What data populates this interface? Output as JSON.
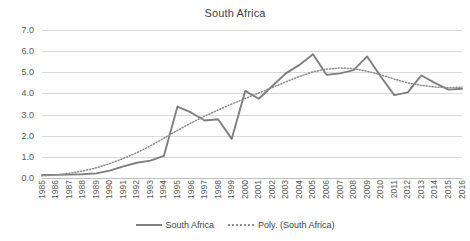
{
  "chart_data": {
    "type": "line",
    "title": "South Africa",
    "xlabel": "",
    "ylabel": "",
    "ylim": [
      0.0,
      7.0
    ],
    "y_ticks": [
      "0.0",
      "1.0",
      "2.0",
      "3.0",
      "4.0",
      "5.0",
      "6.0",
      "7.0"
    ],
    "y_tick_values": [
      0.0,
      1.0,
      2.0,
      3.0,
      4.0,
      5.0,
      6.0,
      7.0
    ],
    "grid": true,
    "legend_position": "bottom",
    "categories": [
      "1985",
      "1986",
      "1987",
      "1988",
      "1989",
      "1990",
      "1991",
      "1992",
      "1993",
      "1994",
      "1995",
      "1996",
      "1997",
      "1998",
      "1999",
      "2000",
      "2001",
      "2002",
      "2003",
      "2004",
      "2005",
      "2006",
      "2007",
      "2008",
      "2009",
      "2010",
      "2011",
      "2012",
      "2013",
      "2014",
      "2015",
      "2016"
    ],
    "series": [
      {
        "name": "South Africa",
        "style": "solid",
        "color": "#7f7f7f",
        "values": [
          0.15,
          0.15,
          0.16,
          0.18,
          0.22,
          0.35,
          0.55,
          0.72,
          0.82,
          1.05,
          3.38,
          3.1,
          2.72,
          2.78,
          1.85,
          4.12,
          3.75,
          4.35,
          4.95,
          5.35,
          5.85,
          4.88,
          4.95,
          5.1,
          5.75,
          4.8,
          3.92,
          4.05,
          4.85,
          4.5,
          4.18,
          4.22
        ]
      },
      {
        "name": "Poly. (South Africa)",
        "style": "dotted",
        "color": "#8c8c8c",
        "values": [
          0.1,
          0.14,
          0.22,
          0.33,
          0.48,
          0.68,
          0.92,
          1.2,
          1.52,
          1.88,
          2.25,
          2.6,
          2.92,
          3.22,
          3.5,
          3.76,
          4.02,
          4.28,
          4.55,
          4.8,
          5.02,
          5.15,
          5.2,
          5.17,
          5.05,
          4.88,
          4.68,
          4.5,
          4.38,
          4.3,
          4.27,
          4.3
        ]
      }
    ]
  },
  "legend": {
    "entries": [
      {
        "label": "South Africa"
      },
      {
        "label": "Poly. (South Africa)"
      }
    ]
  }
}
